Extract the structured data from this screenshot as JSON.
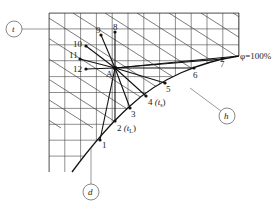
{
  "diagram": {
    "title": "",
    "center_point": {
      "label": "A",
      "x": 115,
      "y": 68
    },
    "curve_label": "φ=100%",
    "curve_points": [
      {
        "id": "1",
        "label": "1",
        "x": 100,
        "y": 140
      },
      {
        "id": "2",
        "label": "2",
        "sub_label": "(t",
        "sub_suffix": "L",
        "close": ")",
        "x": 115,
        "y": 121
      },
      {
        "id": "3",
        "label": "3",
        "x": 130,
        "y": 108
      },
      {
        "id": "4",
        "label": "4",
        "sub_label": "(t",
        "sub_suffix": "s",
        "close": ")",
        "x": 146,
        "y": 96
      },
      {
        "id": "5",
        "label": "5",
        "x": 165,
        "y": 83
      },
      {
        "id": "6",
        "label": "6",
        "x": 194,
        "y": 68
      },
      {
        "id": "7",
        "label": "7",
        "x": 222,
        "y": 59
      }
    ],
    "upper_points": [
      {
        "id": "8",
        "label": "8",
        "x": 115,
        "y": 32
      },
      {
        "id": "9",
        "label": "9",
        "x": 101,
        "y": 35
      },
      {
        "id": "10",
        "label": "10",
        "x": 86,
        "y": 46
      },
      {
        "id": "11",
        "label": "11",
        "x": 80,
        "y": 59
      },
      {
        "id": "12",
        "label": "12",
        "x": 86,
        "y": 69
      }
    ],
    "callouts": [
      {
        "id": "t",
        "label": "t",
        "cx": 14,
        "cy": 29
      },
      {
        "id": "h",
        "label": "h",
        "cx": 227,
        "cy": 116
      },
      {
        "id": "d",
        "label": "d",
        "cx": 91,
        "cy": 192
      }
    ],
    "colors": {
      "line": "#1a1a1a",
      "grid": "#333333",
      "background": "#ffffff"
    }
  }
}
